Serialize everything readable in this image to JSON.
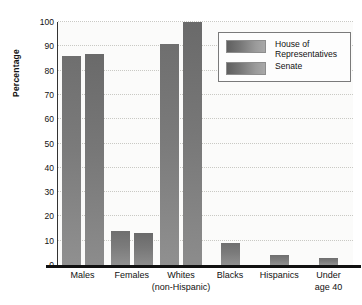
{
  "chart_data": {
    "type": "bar",
    "title": "",
    "xlabel": "",
    "ylabel": "Percentage",
    "ylim": [
      0,
      100
    ],
    "yticks": [
      0,
      10,
      20,
      30,
      40,
      50,
      60,
      70,
      80,
      90,
      100
    ],
    "grid": true,
    "legend_position": "top-right",
    "categories": [
      "Males",
      "Females",
      "Whites (non-Hispanic)",
      "Blacks",
      "Hispanics",
      "Under age 40"
    ],
    "category_labels": [
      {
        "line1": "Males",
        "line2": ""
      },
      {
        "line1": "Females",
        "line2": ""
      },
      {
        "line1": "Whites",
        "line2": "(non-Hispanic)"
      },
      {
        "line1": "Blacks",
        "line2": ""
      },
      {
        "line1": "Hispanics",
        "line2": ""
      },
      {
        "line1": "Under",
        "line2": "age 40"
      }
    ],
    "series": [
      {
        "name": "House of Representatives",
        "values": [
          86,
          14,
          91,
          9,
          4,
          3
        ]
      },
      {
        "name": "Senate",
        "values": [
          87,
          13,
          100,
          null,
          null,
          null
        ]
      }
    ],
    "colors": {
      "house": "#7b7b7b",
      "senate": "#777777",
      "axis": "#111111",
      "gridline": "#c9c9c4",
      "plot_background": "#fbfbfa"
    }
  },
  "legend": {
    "items": [
      {
        "label": "House of\nRepresentatives"
      },
      {
        "label": "Senate"
      }
    ]
  }
}
